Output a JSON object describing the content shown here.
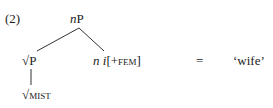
{
  "example": {
    "number": "(2)",
    "root": {
      "head": "n",
      "phrase": "P"
    },
    "left_child": {
      "label": "√P",
      "daughter": {
        "root": "√",
        "word": "mist"
      }
    },
    "right_child": {
      "n": "n",
      "i": "i",
      "feature": "[+fem]"
    },
    "equals": "=",
    "gloss": "‘wife’"
  }
}
